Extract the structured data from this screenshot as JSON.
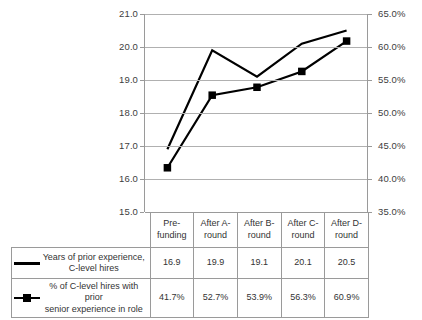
{
  "chart_data": {
    "type": "line",
    "title": "",
    "subtitle": "",
    "xlabel": "",
    "categories": [
      "Pre-funding",
      "After A-round",
      "After B-round",
      "After C-round",
      "After D-round"
    ],
    "category_lines": [
      [
        "Pre-",
        "funding"
      ],
      [
        "After A-",
        "round"
      ],
      [
        "After B-",
        "round"
      ],
      [
        "After C-",
        "round"
      ],
      [
        "After D-",
        "round"
      ]
    ],
    "grid": true,
    "legend_position": "data-table-below",
    "series": [
      {
        "name": "Years of prior experience, C-level hires",
        "name_lines": [
          "Years of prior experience,",
          "C-level hires"
        ],
        "axis": "left",
        "marker": "none",
        "color": "#000000",
        "values": [
          16.9,
          19.9,
          19.1,
          20.1,
          20.5
        ],
        "labels": [
          "16.9",
          "19.9",
          "19.1",
          "20.1",
          "20.5"
        ]
      },
      {
        "name": "% of C-level hires with prior senior experience in role",
        "name_lines": [
          "% of C-level hires with prior",
          "senior experience in role"
        ],
        "axis": "right",
        "marker": "square",
        "color": "#000000",
        "values": [
          41.7,
          52.7,
          53.9,
          56.3,
          60.9
        ],
        "labels": [
          "41.7%",
          "52.7%",
          "53.9%",
          "56.3%",
          "60.9%"
        ]
      }
    ],
    "left_axis": {
      "label": "",
      "ylim": [
        15.0,
        21.0
      ],
      "step": 1.0,
      "ticks": [
        21.0,
        20.0,
        19.0,
        18.0,
        17.0,
        16.0,
        15.0
      ],
      "tick_labels": [
        "21.0",
        "20.0",
        "19.0",
        "18.0",
        "17.0",
        "16.0",
        "15.0"
      ]
    },
    "right_axis": {
      "label": "",
      "ylim": [
        35.0,
        65.0
      ],
      "step": 5.0,
      "ticks": [
        65.0,
        60.0,
        55.0,
        50.0,
        45.0,
        40.0,
        35.0
      ],
      "tick_labels": [
        "65.0%",
        "60.0%",
        "55.0%",
        "50.0%",
        "45.0%",
        "40.0%",
        "35.0%"
      ]
    }
  },
  "icons": {
    "line_swatch": "line-swatch-icon",
    "line_marker_swatch": "line-square-marker-swatch-icon"
  }
}
